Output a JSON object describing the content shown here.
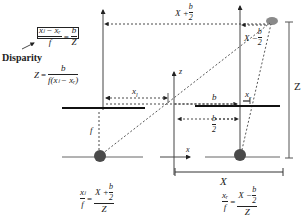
{
  "colors": {
    "ink": "#222222",
    "object": "#8a8a8a",
    "lens": "#4a4a4a"
  },
  "labels": {
    "disparity": "Disparity",
    "z_axis": "z",
    "x_axis": "x",
    "depth": "Z",
    "baseline_distance": "X",
    "focal_length": "f",
    "x_left": "x",
    "x_left_sub": "l",
    "x_right": "x",
    "x_right_sub": "r",
    "b": "b",
    "half_b_num": "b",
    "half_b_den": "2",
    "top_x_plus": "X + ",
    "top_b": "b",
    "top_2": "2",
    "right_x_minus": "X − ",
    "right_b": "b",
    "right_2": "2"
  },
  "equations": {
    "disparity_eq": {
      "num": "xₗ − xᵣ",
      "den": "f",
      "rhs_num": "b",
      "rhs_den": "Z"
    },
    "depth_eq": {
      "lhs": "Z",
      "num": "b",
      "den": "f(xₗ − xᵣ)"
    },
    "left_eq": {
      "lhs_num": "xₗ",
      "lhs_den": "f",
      "rhs_num_a": "X + ",
      "rhs_num_b": "b",
      "rhs_num_c": "2",
      "rhs_den": "Z"
    },
    "right_eq": {
      "lhs_num": "xᵣ",
      "lhs_den": "f",
      "rhs_num_a": "X − ",
      "rhs_num_b": "b",
      "rhs_num_c": "2",
      "rhs_den": "Z"
    }
  }
}
